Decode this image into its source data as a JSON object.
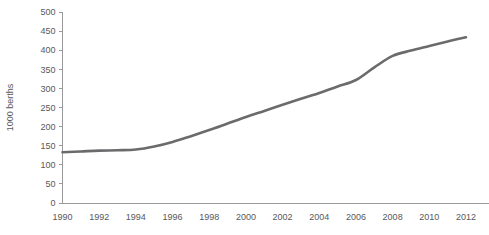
{
  "chart_data": {
    "type": "line",
    "title": "",
    "subtitle": "",
    "xlabel": "",
    "ylabel": "1000 berths",
    "x": [
      1990,
      1991,
      1992,
      1993,
      1994,
      1995,
      1996,
      1997,
      1998,
      1999,
      2000,
      2001,
      2002,
      2003,
      2004,
      2005,
      2006,
      2007,
      2008,
      2009,
      2010,
      2011,
      2012
    ],
    "series": [
      {
        "name": "1000 berths",
        "color": "#6b6b6d",
        "values": [
          133,
          135,
          137,
          138,
          140,
          148,
          160,
          175,
          191,
          208,
          225,
          241,
          257,
          273,
          288,
          305,
          322,
          355,
          385,
          399,
          411,
          423,
          434
        ]
      }
    ],
    "xlim": [
      1990,
      2012
    ],
    "ylim": [
      0,
      500
    ],
    "ytick_labels": [
      "0",
      "50",
      "100",
      "150",
      "200",
      "250",
      "300",
      "350",
      "400",
      "450",
      "500"
    ],
    "ytick_values": [
      0,
      50,
      100,
      150,
      200,
      250,
      300,
      350,
      400,
      450,
      500
    ],
    "xtick_labels": [
      "1990",
      "1992",
      "1994",
      "1996",
      "1998",
      "2000",
      "2002",
      "2004",
      "2006",
      "2008",
      "2010",
      "2012"
    ],
    "xtick_values": [
      1990,
      1992,
      1994,
      1996,
      1998,
      2000,
      2002,
      2004,
      2006,
      2008,
      2010,
      2012
    ],
    "grid": false,
    "legend": false,
    "legend_position": "none",
    "axis_color": "#9a9a9c",
    "text_color": "#58585a",
    "background_color": "#ffffff"
  }
}
